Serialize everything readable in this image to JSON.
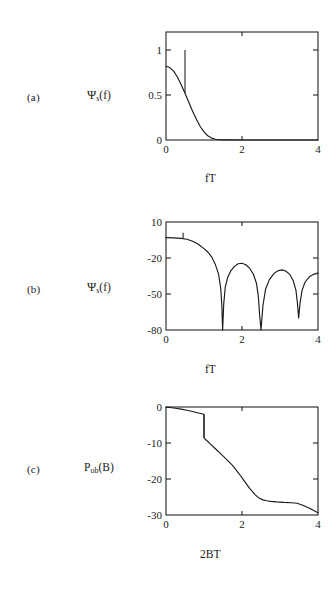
{
  "figure": {
    "background": "#ffffff",
    "ink": "#1a1a1a"
  },
  "panels": [
    {
      "letter": "(a)",
      "ylabel_main": "Ψ",
      "ylabel_sub": "s",
      "ylabel_tail": "(f)",
      "xlabel": "fT"
    },
    {
      "letter": "(b)",
      "ylabel_main": "Ψ",
      "ylabel_sub": "s",
      "ylabel_tail": "(f)",
      "xlabel": "fT"
    },
    {
      "letter": "(c)",
      "ylabel_main": "P",
      "ylabel_sub": "ob",
      "ylabel_tail": "(B)",
      "xlabel": "2BT"
    }
  ],
  "chart_data": [
    {
      "type": "line",
      "panel": "a",
      "title": "",
      "xlabel": "fT",
      "ylabel": "Ψs(f)",
      "xlim": [
        0,
        4
      ],
      "ylim": [
        0,
        1.2
      ],
      "xticks": [
        0,
        2,
        4
      ],
      "xtick_labels": [
        "0",
        "2",
        "4"
      ],
      "yticks": [
        0,
        0.5,
        1
      ],
      "ytick_labels": [
        "0",
        "0.5",
        "1"
      ],
      "grid": false,
      "legend": "none",
      "series": [
        {
          "name": "continuous spectrum",
          "x": [
            0.0,
            0.1,
            0.2,
            0.3,
            0.4,
            0.5,
            0.6,
            0.7,
            0.8,
            0.9,
            1.0,
            1.1,
            1.2,
            1.3,
            1.4,
            1.6,
            2.0,
            2.5,
            3.0,
            3.5,
            4.0
          ],
          "y": [
            0.82,
            0.805,
            0.765,
            0.7,
            0.615,
            0.52,
            0.42,
            0.32,
            0.23,
            0.15,
            0.09,
            0.047,
            0.021,
            0.008,
            0.003,
            0.001,
            0.0,
            0.0,
            0.0,
            0.0,
            0.0
          ]
        }
      ],
      "annotations": [
        {
          "type": "spectral-line",
          "x": 0.5,
          "y_from": 0.52,
          "y_to": 1.0,
          "label": "discrete tone at fT = 0.5"
        }
      ]
    },
    {
      "type": "line",
      "panel": "b",
      "title": "",
      "xlabel": "fT",
      "ylabel": "Ψs(f) [dB]",
      "xlim": [
        0,
        4
      ],
      "ylim": [
        -80,
        10
      ],
      "xticks": [
        0,
        2,
        4
      ],
      "xtick_labels": [
        "0",
        "2",
        "4"
      ],
      "yticks": [
        10,
        -20,
        -50,
        -80
      ],
      "ytick_labels": [
        "10",
        "-20",
        "-50",
        "-80"
      ],
      "grid": false,
      "legend": "none",
      "series": [
        {
          "name": "power spectrum in dB",
          "x": [
            0.0,
            0.2,
            0.4,
            0.55,
            0.7,
            0.85,
            1.0,
            1.1,
            1.2,
            1.3,
            1.38,
            1.44,
            1.47,
            1.49,
            1.52,
            1.56,
            1.62,
            1.7,
            1.8,
            1.9,
            2.0,
            2.1,
            2.2,
            2.3,
            2.38,
            2.43,
            2.46,
            2.5,
            2.55,
            2.62,
            2.72,
            2.85,
            2.95,
            3.05,
            3.15,
            3.25,
            3.35,
            3.42,
            3.46,
            3.49,
            3.53,
            3.58,
            3.66,
            3.78,
            3.9,
            4.0
          ],
          "y": [
            -3.0,
            -3.2,
            -3.6,
            -4.4,
            -6.0,
            -8.6,
            -12.2,
            -15.0,
            -19.0,
            -25.5,
            -33.0,
            -45.0,
            -60.0,
            -80.0,
            -58.0,
            -44.0,
            -36.5,
            -31.0,
            -27.0,
            -24.8,
            -24.4,
            -25.6,
            -28.5,
            -33.5,
            -41.0,
            -52.0,
            -66.0,
            -80.0,
            -60.0,
            -46.0,
            -38.0,
            -32.6,
            -30.6,
            -29.9,
            -30.8,
            -33.4,
            -39.0,
            -47.0,
            -58.0,
            -70.0,
            -57.0,
            -47.0,
            -40.0,
            -35.5,
            -33.4,
            -32.6
          ]
        }
      ],
      "annotations": [
        {
          "type": "spectral-line",
          "x": 0.45,
          "y_from": -3.4,
          "y_to": 1.0,
          "label": "discrete tone"
        }
      ]
    },
    {
      "type": "line",
      "panel": "c",
      "title": "",
      "xlabel": "2BT",
      "ylabel": "Pob(B) [dB]",
      "xlim": [
        0,
        4
      ],
      "ylim": [
        -30,
        0
      ],
      "xticks": [
        0,
        2,
        4
      ],
      "xtick_labels": [
        "0",
        "2",
        "4"
      ],
      "yticks": [
        0,
        -10,
        -20,
        -30
      ],
      "ytick_labels": [
        "0",
        "-10",
        "-20",
        "-30"
      ],
      "grid": false,
      "legend": "none",
      "series": [
        {
          "name": "fractional out-of-band power",
          "x": [
            0.0,
            0.1,
            0.25,
            0.4,
            0.55,
            0.7,
            0.85,
            0.97,
            0.99,
            1.0,
            1.0,
            1.05,
            1.15,
            1.3,
            1.45,
            1.6,
            1.75,
            1.9,
            2.05,
            2.2,
            2.35,
            2.45,
            2.55,
            2.65,
            2.75,
            2.9,
            3.1,
            3.3,
            3.45,
            3.6,
            3.75,
            3.9,
            4.0
          ],
          "y": [
            -0.05,
            -0.15,
            -0.35,
            -0.6,
            -0.9,
            -1.25,
            -1.65,
            -1.95,
            -2.0,
            -2.05,
            -8.5,
            -9.1,
            -10.1,
            -11.6,
            -13.1,
            -14.6,
            -16.2,
            -18.2,
            -20.4,
            -22.6,
            -24.4,
            -25.3,
            -25.8,
            -26.05,
            -26.2,
            -26.35,
            -26.5,
            -26.6,
            -26.75,
            -27.3,
            -28.0,
            -28.8,
            -29.4
          ]
        }
      ],
      "annotations": [
        {
          "type": "step",
          "x": 1.0,
          "y_from": -2.05,
          "y_to": -8.5,
          "label": "discrete spectral line removed at 2BT = 1"
        }
      ]
    }
  ]
}
